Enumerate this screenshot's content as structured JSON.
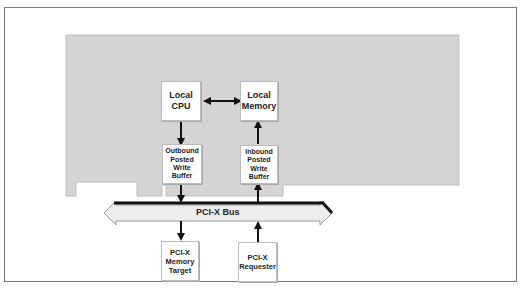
{
  "diagram": {
    "card_label": "",
    "nodes": {
      "local_cpu": {
        "line1": "Local",
        "line2": "CPU"
      },
      "local_memory": {
        "line1": "Local",
        "line2": "Memory"
      },
      "outbound_buffer": {
        "line1": "Outbound",
        "line2": "Posted",
        "line3": "Write",
        "line4": "Buffer"
      },
      "inbound_buffer": {
        "line1": "Inbound",
        "line2": "Posted",
        "line3": "Write",
        "line4": "Buffer"
      },
      "pcix_target": {
        "line1": "PCI-X",
        "line2": "Memory",
        "line3": "Target"
      },
      "pcix_requester": {
        "line1": "PCI-X",
        "line2": "Requester"
      }
    },
    "bus": {
      "label": "PCI-X Bus"
    },
    "edges": [
      {
        "from": "local_cpu",
        "to": "local_memory",
        "type": "bidirectional"
      },
      {
        "from": "local_cpu",
        "to": "outbound_buffer",
        "type": "directed"
      },
      {
        "from": "outbound_buffer",
        "to": "pcix_bus",
        "type": "directed"
      },
      {
        "from": "pcix_bus",
        "to": "pcix_target",
        "type": "directed"
      },
      {
        "from": "pcix_requester",
        "to": "pcix_bus",
        "type": "directed"
      },
      {
        "from": "pcix_bus",
        "to": "inbound_buffer",
        "type": "directed"
      },
      {
        "from": "inbound_buffer",
        "to": "local_memory",
        "type": "directed"
      }
    ],
    "colors": {
      "card": "#d4d4d4",
      "box": "#ffffff",
      "bus_fill": "#eeeeee",
      "bus_edge": "#111111"
    }
  }
}
